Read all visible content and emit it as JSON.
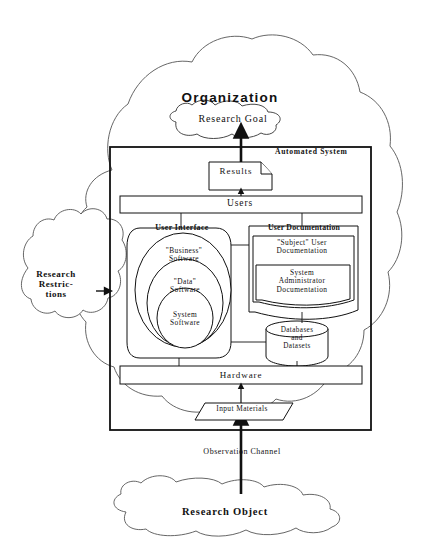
{
  "diagram": {
    "colors": {
      "stroke": "#1a1a1a",
      "fill": "#ffffff",
      "text": "#111111"
    },
    "nodes": {
      "organization": {
        "label": "Organization",
        "shape": "cloud"
      },
      "research_goal": {
        "label": "Research Goal",
        "shape": "cloud"
      },
      "automated_system": {
        "label": "Automated System",
        "shape": "rectangle"
      },
      "results": {
        "label": "Results",
        "shape": "document"
      },
      "users": {
        "label": "Users",
        "shape": "bar"
      },
      "user_interface": {
        "label": "User Interface",
        "shape": "rounded-container"
      },
      "business_software": {
        "label_line1": "\"Business\"",
        "label_line2": "Software",
        "shape": "ellipse"
      },
      "data_software": {
        "label_line1": "\"Data\"",
        "label_line2": "Software",
        "shape": "ellipse"
      },
      "system_software": {
        "label_line1": "System",
        "label_line2": "Software",
        "shape": "ellipse"
      },
      "user_documentation": {
        "label": "User Documentation",
        "shape": "document-stack"
      },
      "subject_user_documentation": {
        "label_line1": "\"Subject\" User",
        "label_line2": "Documentation",
        "shape": "document"
      },
      "system_administrator_documentation": {
        "label_line1": "System",
        "label_line2": "Administrator",
        "label_line3": "Documentation",
        "shape": "document"
      },
      "databases_and_datasets": {
        "label_line1": "Databases",
        "label_line2": "and",
        "label_line3": "Datasets",
        "shape": "cylinder"
      },
      "hardware": {
        "label": "Hardware",
        "shape": "bar"
      },
      "input_materials": {
        "label": "Input Materials",
        "shape": "parallelogram"
      },
      "research_object": {
        "label": "Research Object",
        "shape": "cloud"
      },
      "research_restrictions": {
        "label_line1": "Research",
        "label_line2": "Restric-",
        "label_line3": "tions",
        "shape": "cloud"
      }
    },
    "edges": [
      {
        "name": "results-to-goal",
        "from": "results",
        "to": "research_goal",
        "style": "thick-arrow"
      },
      {
        "name": "users-to-results",
        "from": "users",
        "to": "results",
        "style": "arrow"
      },
      {
        "name": "users-to-user-interface",
        "from": "users",
        "to": "user_interface",
        "style": "line"
      },
      {
        "name": "users-to-user-documentation",
        "from": "users",
        "to": "user_documentation",
        "style": "line"
      },
      {
        "name": "user-interface-to-user-documentation",
        "from": "user_interface",
        "to": "user_documentation",
        "style": "line"
      },
      {
        "name": "user-interface-to-databases",
        "from": "user_interface",
        "to": "databases_and_datasets",
        "style": "line"
      },
      {
        "name": "user-documentation-to-databases",
        "from": "user_documentation",
        "to": "databases_and_datasets",
        "style": "line"
      },
      {
        "name": "user-interface-to-hardware",
        "from": "user_interface",
        "to": "hardware",
        "style": "line"
      },
      {
        "name": "databases-to-hardware",
        "from": "databases_and_datasets",
        "to": "hardware",
        "style": "line"
      },
      {
        "name": "input-materials-to-hardware",
        "from": "input_materials",
        "to": "hardware",
        "style": "arrow"
      },
      {
        "name": "research-object-to-input-materials",
        "from": "research_object",
        "to": "input_materials",
        "style": "thick-arrow",
        "label": "Observation Channel"
      },
      {
        "name": "research-restrictions-to-automated-system",
        "from": "research_restrictions",
        "to": "automated_system",
        "style": "arrow"
      }
    ],
    "edge_labels": {
      "observation_channel": "Observation Channel"
    }
  }
}
